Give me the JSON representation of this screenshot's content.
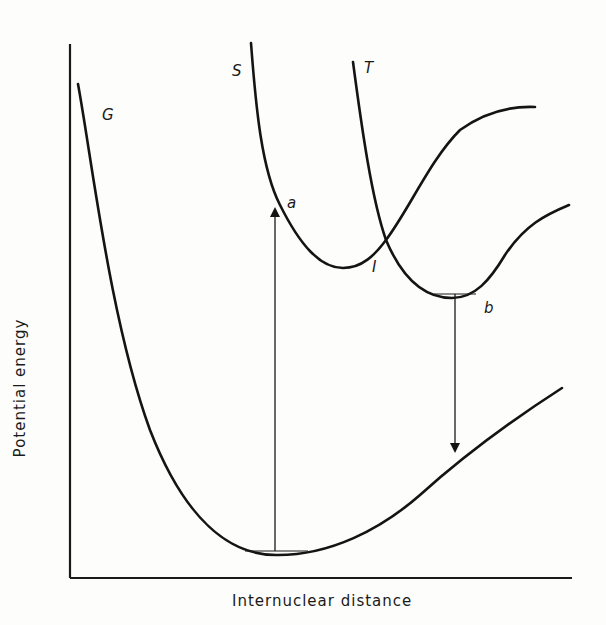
{
  "diagram": {
    "type": "potential-energy-curves",
    "xlabel": "Internuclear distance",
    "ylabel": "Potential energy",
    "curves": [
      {
        "id": "G",
        "label": "G",
        "description": "ground state"
      },
      {
        "id": "S",
        "label": "S",
        "description": "excited singlet state"
      },
      {
        "id": "T",
        "label": "T",
        "description": "triplet state"
      }
    ],
    "points": [
      {
        "id": "a",
        "label": "a"
      },
      {
        "id": "b",
        "label": "b"
      },
      {
        "id": "I",
        "label": "I",
        "description": "intersection of S and T"
      }
    ],
    "transitions": [
      {
        "from": "G minimum",
        "to": "a",
        "direction": "up"
      },
      {
        "from": "b",
        "to": "G",
        "direction": "down"
      }
    ],
    "colors": {
      "ink": "#141414",
      "paper": "#fdfdfb"
    }
  }
}
